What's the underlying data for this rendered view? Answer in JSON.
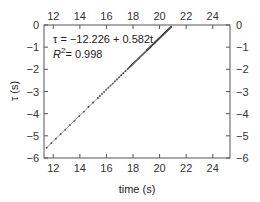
{
  "chart_data": {
    "type": "scatter",
    "title": "",
    "xlabel": "time (s)",
    "ylabel": "τ (s)",
    "xlim": [
      11.3,
      25.3
    ],
    "ylim": [
      -6,
      0
    ],
    "xticks": [
      12,
      14,
      16,
      18,
      20,
      22,
      24
    ],
    "yticks": [
      0,
      -1,
      -2,
      -3,
      -4,
      -5,
      -6
    ],
    "xtick_labels": [
      "12",
      "14",
      "16",
      "18",
      "20",
      "22",
      "24"
    ],
    "ytick_labels": [
      "0",
      "−1",
      "−2",
      "−3",
      "−4",
      "−5",
      "−6"
    ],
    "grid": false,
    "mirror_axes": true,
    "fit": {
      "intercept": -12.226,
      "slope": 0.582,
      "label": "τ = −12.226 + 0.582t",
      "r2_label": "R",
      "r2_sup": "2",
      "r2_value": "= 0.998"
    },
    "series": [
      {
        "name": "data",
        "x_start": 11.5,
        "x_end": 20.9,
        "sparse_until": 15.0,
        "density_note": "points become denser toward larger t"
      }
    ],
    "colors": {
      "points": "#222222",
      "axes": "#555555"
    }
  }
}
